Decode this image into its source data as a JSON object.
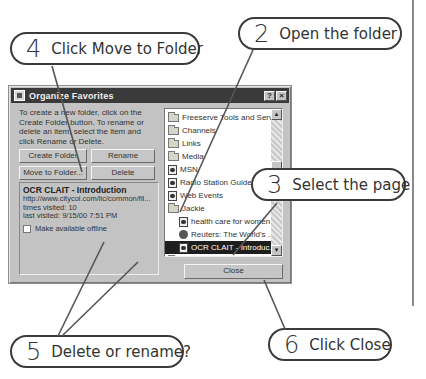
{
  "dialog": {
    "title": "Organize Favorites",
    "help_button": "?",
    "close_x": "×",
    "instructions": "To create a new folder, click on the Create Folder button. To rename or delete an item, select the item and click Rename or Delete.",
    "buttons": {
      "create_folder": "Create Folder",
      "rename": "Rename",
      "move_to_folder": "Move to Folder...",
      "delete": "Delete",
      "close": "Close"
    },
    "info": {
      "title": "OCR CLAIT - Introduction",
      "url": "http://www.citycol.com/lic/common/fil...",
      "times_visited": "times visited: 10",
      "last_visited": "last visited: 9/15/00 7:51 PM",
      "offline_label": "Make available offline",
      "offline_checked": false
    },
    "tree": [
      {
        "label": "Freeserve Tools and Servi...",
        "icon": "folder-icon",
        "child": false,
        "selected": false
      },
      {
        "label": "Channels",
        "icon": "folder-icon",
        "child": false,
        "selected": false
      },
      {
        "label": "Links",
        "icon": "folder-icon",
        "child": false,
        "selected": false
      },
      {
        "label": "Media",
        "icon": "folder-icon",
        "child": false,
        "selected": false
      },
      {
        "label": "MSN",
        "icon": "web-page-icon",
        "child": false,
        "selected": false
      },
      {
        "label": "Radio Station Guide",
        "icon": "web-page-icon",
        "child": false,
        "selected": false
      },
      {
        "label": "Web Events",
        "icon": "web-page-icon",
        "child": false,
        "selected": false
      },
      {
        "label": "Jackie",
        "icon": "open-folder-icon",
        "child": false,
        "selected": false
      },
      {
        "label": "health care for women",
        "icon": "web-page-icon",
        "child": true,
        "selected": false
      },
      {
        "label": "Reuters: The World's ...",
        "icon": "globe-icon",
        "child": true,
        "selected": false
      },
      {
        "label": "OCR CLAIT - Introduc...",
        "icon": "web-page-icon",
        "child": true,
        "selected": true
      },
      {
        "label": "William",
        "icon": "folder-icon",
        "child": false,
        "selected": false
      }
    ]
  },
  "callouts": [
    {
      "num": "4",
      "text": "Click Move to Folder"
    },
    {
      "num": "2",
      "text": "Open the folder"
    },
    {
      "num": "3",
      "text": "Select the page"
    },
    {
      "num": "5",
      "text": "Delete or rename?"
    },
    {
      "num": "6",
      "text": "Click Close"
    }
  ]
}
